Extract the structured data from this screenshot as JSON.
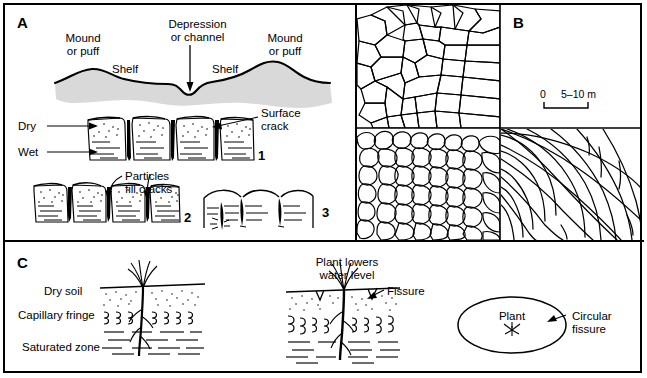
{
  "figure": {
    "panels": [
      {
        "id": "A",
        "letter": "A"
      },
      {
        "id": "B",
        "letter": "B"
      },
      {
        "id": "C",
        "letter": "C"
      }
    ]
  },
  "panel_a": {
    "letter": "A",
    "labels": {
      "mound_left": "Mound\nor puff",
      "depression": "Depression\nor channel",
      "mound_right": "Mound\nor puff",
      "shelf_left": "Shelf",
      "shelf_right": "Shelf",
      "dry": "Dry",
      "wet": "Wet",
      "surface_crack": "Surface\ncrack",
      "particles_fill_cracks": "Particles\nfill cracks"
    },
    "stages": [
      {
        "number": "1"
      },
      {
        "number": "2"
      },
      {
        "number": "3"
      }
    ],
    "stage_numbers": [
      "1",
      "2",
      "3"
    ]
  },
  "panel_b": {
    "letter": "B",
    "scale_bar": {
      "left_label": "0",
      "right_label": "5–10 m"
    },
    "quadrants": [
      {
        "name": "large-irregular-polygons"
      },
      {
        "name": "scale-bar-panel"
      },
      {
        "name": "small-rounded-polygons"
      },
      {
        "name": "curved-radial-fissures"
      }
    ]
  },
  "panel_c": {
    "letter": "C",
    "labels": {
      "dry_soil": "Dry soil",
      "capillary_fringe": "Capillary fringe",
      "saturated_zone": "Saturated zone",
      "plant_lowers_water_level": "Plant lowers\nwater level",
      "fissure": "Fissure",
      "plant": "Plant",
      "circular_fissure": "Circular\nfissure"
    }
  },
  "colors": {
    "line": "#000000",
    "ground_fill": "#d9d9d9",
    "background": "#ffffff"
  }
}
